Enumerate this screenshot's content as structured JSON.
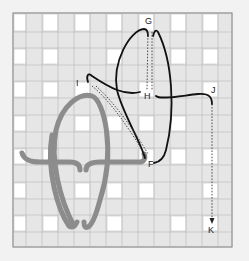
{
  "diagram": {
    "type": "embroidery stitch diagram on woven canvas",
    "labels": {
      "G": "G",
      "H": "H",
      "I": "I",
      "J": "J",
      "F": "F",
      "K": "K"
    },
    "colors": {
      "background": "#f2f2f2",
      "canvas_strip": "#e4e4e4",
      "canvas_hole": "#ffffff",
      "canvas_line": "#b8b8b8",
      "gray_thread": "#8a8a8a",
      "black_thread": "#111111"
    }
  }
}
